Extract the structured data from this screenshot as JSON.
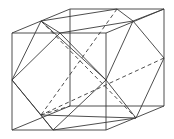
{
  "diagram": {
    "stroke_color": "#3a3a3a",
    "cube_front": [
      [
        12,
        33
      ],
      [
        106,
        33
      ],
      [
        106,
        130
      ],
      [
        12,
        130
      ]
    ],
    "cube_back": [
      [
        70,
        9
      ],
      [
        164,
        9
      ],
      [
        164,
        106
      ],
      [
        70,
        106
      ]
    ],
    "solid_edges": [
      [
        [
          12,
          33
        ],
        [
          70,
          9
        ]
      ],
      [
        [
          106,
          33
        ],
        [
          164,
          9
        ]
      ],
      [
        [
          12,
          130
        ],
        [
          70,
          106
        ]
      ],
      [
        [
          106,
          130
        ],
        [
          164,
          106
        ]
      ],
      [
        [
          41,
          21
        ],
        [
          117,
          9
        ]
      ],
      [
        [
          41,
          21
        ],
        [
          60,
          33
        ]
      ],
      [
        [
          41,
          21
        ],
        [
          12,
          80
        ]
      ],
      [
        [
          117,
          9
        ],
        [
          133,
          21
        ]
      ],
      [
        [
          133,
          21
        ],
        [
          164,
          58
        ]
      ],
      [
        [
          133,
          21
        ],
        [
          60,
          33
        ]
      ],
      [
        [
          60,
          33
        ],
        [
          106,
          80
        ]
      ],
      [
        [
          60,
          33
        ],
        [
          12,
          80
        ]
      ],
      [
        [
          41,
          21
        ],
        [
          106,
          80
        ]
      ],
      [
        [
          12,
          80
        ],
        [
          53,
          130
        ]
      ],
      [
        [
          53,
          130
        ],
        [
          106,
          80
        ]
      ],
      [
        [
          106,
          80
        ],
        [
          136,
          118
        ]
      ],
      [
        [
          164,
          58
        ],
        [
          136,
          118
        ]
      ],
      [
        [
          53,
          130
        ],
        [
          136,
          118
        ]
      ],
      [
        [
          12,
          80
        ],
        [
          41,
          115
        ]
      ],
      [
        [
          41,
          115
        ],
        [
          53,
          130
        ]
      ],
      [
        [
          41,
          115
        ],
        [
          136,
          118
        ]
      ],
      [
        [
          133,
          21
        ],
        [
          164,
          9
        ]
      ],
      [
        [
          106,
          80
        ],
        [
          133,
          21
        ]
      ]
    ],
    "dashed_edges": [
      [
        [
          41,
          21
        ],
        [
          136,
          118
        ]
      ],
      [
        [
          117,
          9
        ],
        [
          41,
          115
        ]
      ],
      [
        [
          164,
          58
        ],
        [
          41,
          115
        ]
      ],
      [
        [
          41,
          115
        ],
        [
          70,
          106
        ]
      ]
    ]
  }
}
